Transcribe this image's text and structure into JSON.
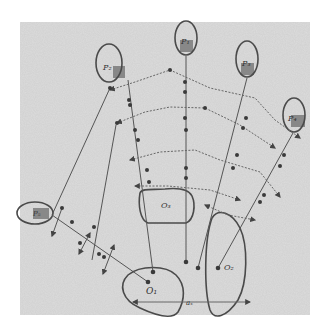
{
  "diagram": {
    "type": "hand-drawn object/part graph",
    "background": "#d9d9d9",
    "stroke_color": "#555555",
    "region_stroke": "#4a4a4a",
    "patch_fill": "#7a7a7a",
    "parts": [
      {
        "id": "p1",
        "label": "P₁",
        "ellipse": {
          "cx": 186,
          "cy": 38,
          "rx": 11,
          "ry": 17
        },
        "anchor": [
          186,
          56
        ]
      },
      {
        "id": "p2",
        "label": "P₂",
        "ellipse": {
          "cx": 109,
          "cy": 63,
          "rx": 13,
          "ry": 19
        },
        "anchor": [
          110,
          82
        ]
      },
      {
        "id": "p3",
        "label": "P₃",
        "ellipse": {
          "cx": 247,
          "cy": 59,
          "rx": 11,
          "ry": 18
        },
        "anchor": [
          247,
          77
        ]
      },
      {
        "id": "p4",
        "label": "P₄",
        "ellipse": {
          "cx": 294,
          "cy": 115,
          "rx": 11,
          "ry": 17
        },
        "anchor": [
          293,
          132
        ]
      },
      {
        "id": "p5",
        "label": "P₅",
        "ellipse": {
          "cx": 35,
          "cy": 213,
          "rx": 18,
          "ry": 11
        },
        "anchor": [
          52,
          214
        ]
      }
    ],
    "objects": [
      {
        "id": "o1",
        "label": "O₁",
        "label_pos": [
          148,
          293
        ]
      },
      {
        "id": "o2",
        "label": "O₂",
        "label_pos": [
          226,
          268
        ]
      },
      {
        "id": "o3",
        "label": "O₃",
        "label_pos": [
          165,
          207
        ]
      }
    ],
    "axis_label": "aₓ"
  }
}
